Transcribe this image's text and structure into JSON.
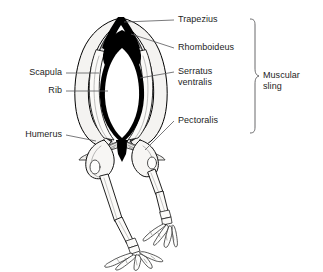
{
  "figure": {
    "background_color": "#ffffff",
    "ink_color": "#000000",
    "text_color": "#1d1d1d",
    "leader_color": "#58585a"
  },
  "labels": {
    "trapezius": "Trapezius",
    "rhomboideus": "Rhomboideus",
    "serratus_line1": "Serratus",
    "serratus_line2": "ventralis",
    "pectoralis": "Pectoralis",
    "scapula": "Scapula",
    "rib": "Rib",
    "humerus": "Humerus"
  },
  "bracket": {
    "label_line1": "Muscular",
    "label_line2": "sling",
    "grouped_labels": [
      "Trapezius",
      "Rhomboideus",
      "Serratus ventralis",
      "Pectoralis"
    ]
  }
}
